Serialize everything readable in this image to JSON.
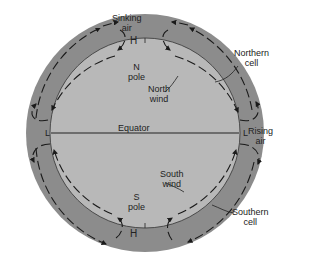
{
  "diagram": {
    "colors": {
      "outer_ring": "#8c8c8c",
      "inner_globe": "#b8b8b8",
      "arrows": "#1a1a1a",
      "background": "#ffffff"
    },
    "labels": {
      "sinking_air_1": "Sinking",
      "sinking_air_2": "air",
      "high_top": "H",
      "n_pole_1": "N",
      "n_pole_2": "pole",
      "northern_cell_1": "Northern",
      "northern_cell_2": "cell",
      "north_wind_1": "North",
      "north_wind_2": "wind",
      "low_left": "L",
      "low_right": "L",
      "equator": "Equator",
      "rising_air_1": "Rising",
      "rising_air_2": "air",
      "south_wind_1": "South",
      "south_wind_2": "wind",
      "s_pole_1": "S",
      "s_pole_2": "pole",
      "high_bottom": "H",
      "southern_cell_1": "Southern",
      "southern_cell_2": "cell"
    }
  }
}
